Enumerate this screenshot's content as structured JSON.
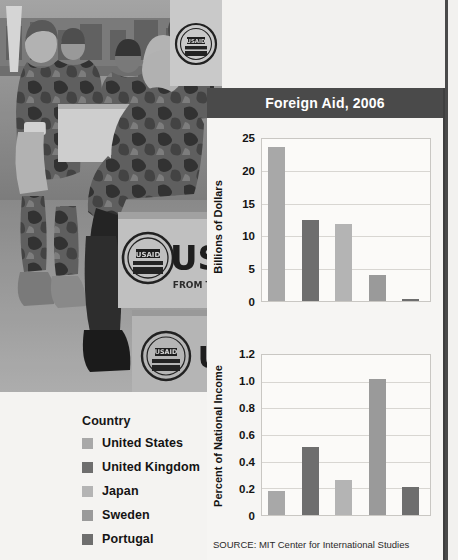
{
  "panel": {
    "title": "Foreign Aid, 2006",
    "source": "SOURCE: MIT Center for International Studies",
    "title_bg": "#4a4a4a"
  },
  "legend": {
    "title": "Country",
    "items": [
      {
        "label": "United States",
        "color": "#a8a8a8",
        "swatch_name": "legend-swatch-united-states"
      },
      {
        "label": "United Kingdom",
        "color": "#6e6e6e",
        "swatch_name": "legend-swatch-united-kingdom"
      },
      {
        "label": "Japan",
        "color": "#b4b4b4",
        "swatch_name": "legend-swatch-japan"
      },
      {
        "label": "Sweden",
        "color": "#9a9a9a",
        "swatch_name": "legend-swatch-sweden"
      },
      {
        "label": "Portugal",
        "color": "#6e6e6e",
        "swatch_name": "legend-swatch-portugal"
      }
    ]
  },
  "photo": {
    "caption_visible_text": "USAID",
    "description": "Grayscale photo of military personnel unloading USAID relief boxes"
  },
  "chart_data": [
    {
      "id": "chart-billions",
      "type": "bar",
      "title": "Foreign Aid, 2006",
      "xlabel": "",
      "ylabel": "Billions of Dollars",
      "categories": [
        "United States",
        "United Kingdom",
        "Japan",
        "Sweden",
        "Portugal"
      ],
      "values": [
        23.8,
        12.5,
        11.9,
        4.0,
        0.3
      ],
      "colors": [
        "#a8a8a8",
        "#6e6e6e",
        "#b4b4b4",
        "#9a9a9a",
        "#6e6e6e"
      ],
      "ylim": [
        0,
        25
      ],
      "yticks": [
        0,
        5,
        10,
        15,
        20,
        25
      ],
      "ytick_labels": [
        "0",
        "5",
        "10",
        "15",
        "20",
        "25"
      ],
      "grid": true,
      "legend_position": "external-left"
    },
    {
      "id": "chart-percent",
      "type": "bar",
      "title": "",
      "xlabel": "",
      "ylabel": "Percent of National Income",
      "categories": [
        "United States",
        "United Kingdom",
        "Japan",
        "Sweden",
        "Portugal"
      ],
      "values": [
        0.18,
        0.51,
        0.26,
        1.02,
        0.21
      ],
      "colors": [
        "#a8a8a8",
        "#6e6e6e",
        "#b4b4b4",
        "#9a9a9a",
        "#6e6e6e"
      ],
      "ylim": [
        0,
        1.2
      ],
      "yticks": [
        0,
        0.2,
        0.4,
        0.6,
        0.8,
        1.0,
        1.2
      ],
      "ytick_labels": [
        "0",
        "0.2",
        "0.4",
        "0.6",
        "0.8",
        "1.0",
        "1.2"
      ],
      "grid": true,
      "legend_position": "external-left"
    }
  ]
}
